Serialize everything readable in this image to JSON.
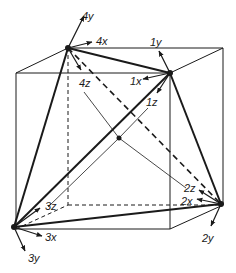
{
  "diagram": {
    "type": "tetrahedron-in-cube",
    "cube": {
      "front": [
        [
          16,
          73
        ],
        [
          170,
          73
        ],
        [
          170,
          229
        ],
        [
          16,
          229
        ]
      ],
      "back": [
        [
          68,
          48
        ],
        [
          223,
          48
        ],
        [
          223,
          205
        ],
        [
          68,
          205
        ]
      ]
    },
    "center": [
      119,
      138
    ],
    "vertices": [
      {
        "id": "1",
        "pos": [
          170,
          73
        ]
      },
      {
        "id": "2",
        "pos": [
          221,
          204
        ]
      },
      {
        "id": "3",
        "pos": [
          14,
          227
        ]
      },
      {
        "id": "4",
        "pos": [
          68,
          48
        ]
      }
    ],
    "labels": [
      {
        "text": "4y",
        "x": 82,
        "y": 20
      },
      {
        "text": "4x",
        "x": 96,
        "y": 45
      },
      {
        "text": "4z",
        "x": 79,
        "y": 87
      },
      {
        "text": "1y",
        "x": 150,
        "y": 46
      },
      {
        "text": "1x",
        "x": 130,
        "y": 85
      },
      {
        "text": "1z",
        "x": 146,
        "y": 106
      },
      {
        "text": "2z",
        "x": 184,
        "y": 192
      },
      {
        "text": "2x",
        "x": 181,
        "y": 205
      },
      {
        "text": "2y",
        "x": 202,
        "y": 242
      },
      {
        "text": "3z",
        "x": 45,
        "y": 210
      },
      {
        "text": "3x",
        "x": 45,
        "y": 241
      },
      {
        "text": "3y",
        "x": 28,
        "y": 262
      }
    ]
  }
}
